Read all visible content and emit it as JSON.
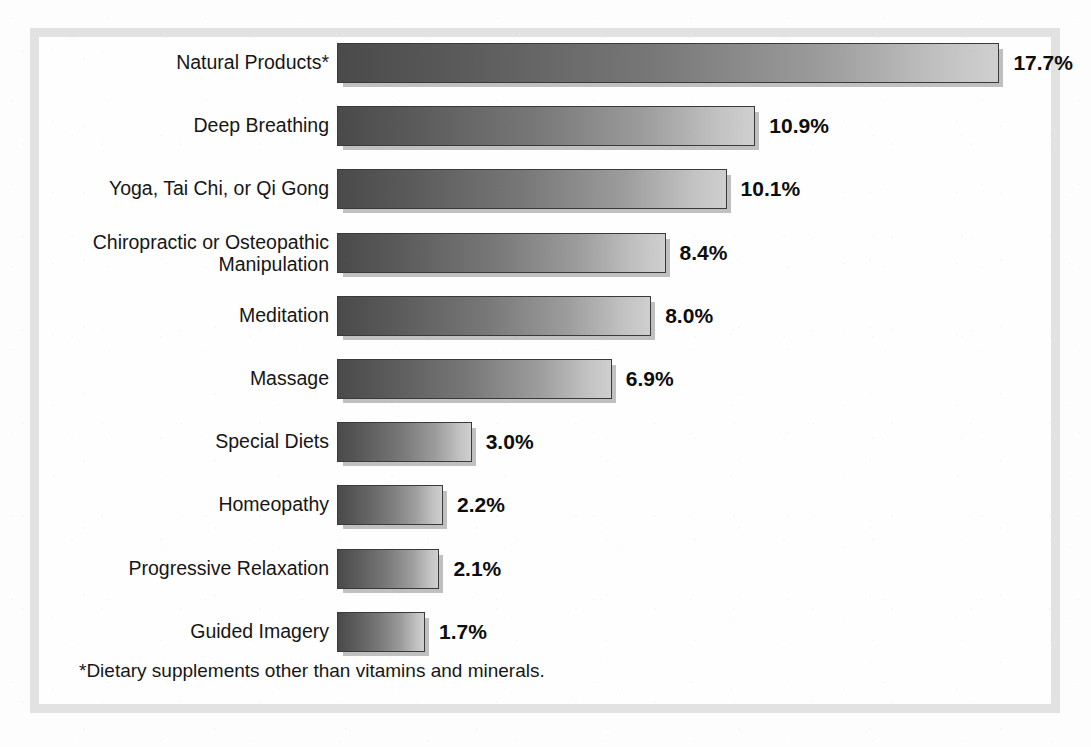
{
  "chart_data": {
    "type": "bar",
    "orientation": "horizontal",
    "title": "",
    "subtitle": "",
    "xlabel": "",
    "ylabel": "",
    "grid": false,
    "legend": null,
    "axis_visible": false,
    "value_suffix": "%",
    "xlim": [
      0,
      17.7
    ],
    "categories": [
      "Natural Products*",
      "Deep Breathing",
      "Yoga, Tai Chi, or Qi Gong",
      "Chiropractic or Osteopathic\nManipulation",
      "Meditation",
      "Massage",
      "Special Diets",
      "Homeopathy",
      "Progressive Relaxation",
      "Guided Imagery"
    ],
    "values": [
      17.7,
      10.9,
      10.1,
      8.4,
      8.0,
      6.9,
      3.0,
      2.2,
      2.1,
      1.7
    ],
    "value_labels": [
      "17.7%",
      "10.9%",
      "10.1%",
      "8.4%",
      "8.0%",
      "6.9%",
      "3.0%",
      "2.2%",
      "2.1%",
      "1.7%"
    ],
    "bar_fill_start_color": "#4a4a4a",
    "bar_fill_end_color": "#cfcfcf",
    "bar_border_color": "#3a3a3a",
    "frame_color": "#e2e2e2",
    "background_color": "#fefefe",
    "text_color": "#161616"
  },
  "footnote": {
    "text": "*Dietary supplements other than vitamins and minerals."
  }
}
